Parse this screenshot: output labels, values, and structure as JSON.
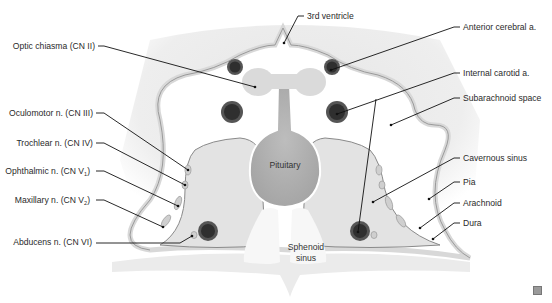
{
  "diagram": {
    "colors": {
      "background_brain": "#ececec",
      "subarachnoid": "#ffffff",
      "pia_arachnoid_band": "#dcdcdc",
      "membrane_line": "#9a9a9a",
      "cavernous_sinus": "#e2e2e2",
      "pituitary": "#b0b0b0",
      "chiasma": "#dadada",
      "artery_outer": "#4a4a4a",
      "artery_inner": "#2d2d2d",
      "nerve": "#cfcfcf",
      "sphenoid_bone": "#e9e9e9",
      "sphenoid_sinus": "#f6f6f6",
      "leader": "#111111"
    },
    "left_labels": [
      {
        "id": "optic-chiasma",
        "text": "Optic chiasma (CN II)"
      },
      {
        "id": "oculomotor",
        "text": "Oculomotor n. (CN III)"
      },
      {
        "id": "trochlear",
        "text": "Trochlear n. (CN IV)"
      },
      {
        "id": "ophthalmic",
        "text": "Ophthalmic n. (CN V",
        "sub": "1",
        "suffix": ")"
      },
      {
        "id": "maxillary",
        "text": "Maxillary n. (CN V",
        "sub": "2",
        "suffix": ")"
      },
      {
        "id": "abducens",
        "text": "Abducens n. (CN VI)"
      }
    ],
    "right_labels": [
      {
        "id": "third-ventricle",
        "text": "3rd ventricle"
      },
      {
        "id": "anterior-cerebral",
        "text": "Anterior cerebral a."
      },
      {
        "id": "internal-carotid",
        "text": "Internal carotid a."
      },
      {
        "id": "subarachnoid",
        "text": "Subarachnoid space"
      },
      {
        "id": "cavernous-sinus",
        "text": "Cavernous sinus"
      },
      {
        "id": "pia",
        "text": "Pia"
      },
      {
        "id": "arachnoid",
        "text": "Arachnoid"
      },
      {
        "id": "dura",
        "text": "Dura"
      }
    ],
    "inner_labels": {
      "pituitary": "Pituitary",
      "sphenoid_line1": "Sphenoid",
      "sphenoid_line2": "sinus"
    }
  }
}
